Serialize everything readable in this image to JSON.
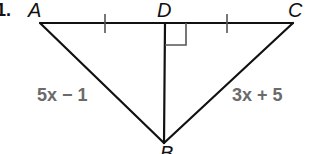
{
  "problem_number": "1.",
  "vertices": {
    "A": {
      "label": "A",
      "x": 40,
      "y": 23
    },
    "D": {
      "label": "D",
      "x": 165,
      "y": 23
    },
    "C": {
      "label": "C",
      "x": 293,
      "y": 23
    },
    "B": {
      "label": "B",
      "x": 164,
      "y": 143
    }
  },
  "side_labels": {
    "AB": "5x − 1",
    "CB": "3x + 5"
  },
  "markings": {
    "congruent_ticks": [
      "AD",
      "DC"
    ],
    "right_angle": "ADB"
  },
  "colors": {
    "stroke": "#111111",
    "expression": "#6b6b6b"
  }
}
